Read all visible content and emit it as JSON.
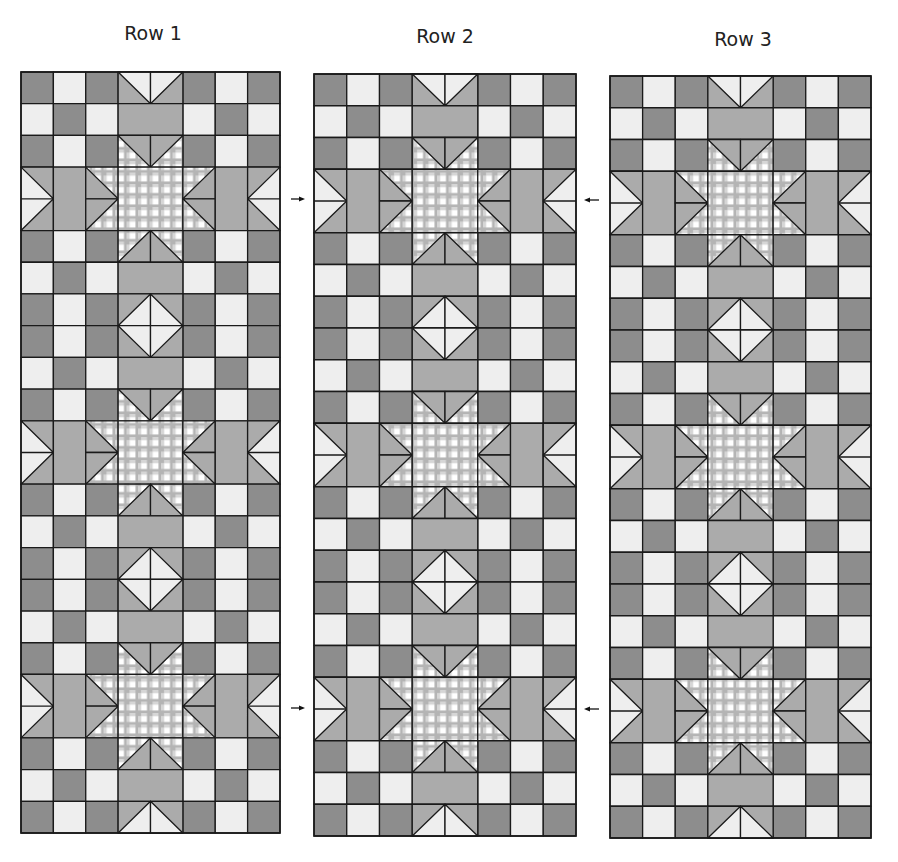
{
  "colors": {
    "dark": "#8d8d8d",
    "light": "#eeeeee",
    "medium": "#ababab",
    "gingham_stripe": "#b4b4b4",
    "gingham_white": "#ffffff",
    "line": "#1a1a1a"
  },
  "grid": {
    "cols": 8,
    "rows": 24
  },
  "panels": [
    {
      "label": "Row 1",
      "label_x": 153,
      "label_y": 22,
      "x": 21,
      "y": 72,
      "w": 259,
      "h": 761
    },
    {
      "label": "Row 2",
      "label_x": 445,
      "label_y": 25,
      "x": 314,
      "y": 74,
      "w": 262,
      "h": 762
    },
    {
      "label": "Row 3",
      "label_x": 743,
      "label_y": 28,
      "x": 610,
      "y": 76,
      "w": 261,
      "h": 762
    }
  ],
  "row_pattern": [
    {
      "side": "DLD",
      "center": "v-top"
    },
    {
      "side": "LDL",
      "center": "medium"
    },
    {
      "side": "DLD",
      "center": "star-top"
    },
    {
      "side": "band",
      "center": "star-band-a"
    },
    {
      "side": "band",
      "center": "star-band-b"
    },
    {
      "side": "DLD",
      "center": "star-bottom"
    },
    {
      "side": "LDL",
      "center": "medium"
    },
    {
      "side": "DLD",
      "center": "diamond-top"
    },
    {
      "side": "DLD",
      "center": "diamond-bottom"
    },
    {
      "side": "LDL",
      "center": "medium"
    },
    {
      "side": "DLD",
      "center": "star-top"
    },
    {
      "side": "band",
      "center": "star-band-a"
    },
    {
      "side": "band",
      "center": "star-band-b"
    },
    {
      "side": "DLD",
      "center": "star-bottom"
    },
    {
      "side": "LDL",
      "center": "medium"
    },
    {
      "side": "DLD",
      "center": "diamond-top"
    },
    {
      "side": "DLD",
      "center": "diamond-bottom"
    },
    {
      "side": "LDL",
      "center": "medium"
    },
    {
      "side": "DLD",
      "center": "star-top"
    },
    {
      "side": "band",
      "center": "star-band-a"
    },
    {
      "side": "band",
      "center": "star-band-b"
    },
    {
      "side": "DLD",
      "center": "star-bottom"
    },
    {
      "side": "LDL",
      "center": "medium"
    },
    {
      "side": "DLD",
      "center": "v-bottom"
    }
  ],
  "arrows": [
    {
      "dir": "right",
      "x": 291,
      "y": 199,
      "len": 14
    },
    {
      "dir": "left",
      "x": 584,
      "y": 200,
      "len": 15
    },
    {
      "dir": "right",
      "x": 291,
      "y": 708,
      "len": 14
    },
    {
      "dir": "left",
      "x": 584,
      "y": 709,
      "len": 15
    }
  ]
}
